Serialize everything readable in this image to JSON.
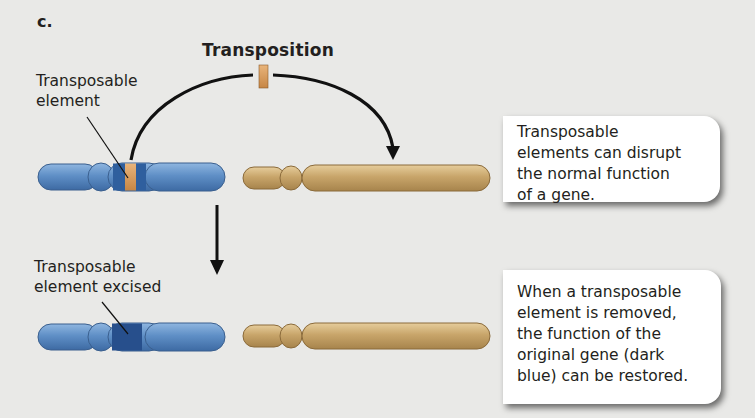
{
  "panel_label": "c.",
  "title": "Transposition",
  "labels": {
    "transposable_element": [
      "Transposable",
      "element"
    ],
    "element_excised": [
      "Transposable",
      "element excised"
    ]
  },
  "callouts": [
    {
      "lines": [
        "Transposable",
        "elements can disrupt",
        "the normal function",
        "of a gene."
      ]
    },
    {
      "lines": [
        "When a transposable",
        "element is removed,",
        "the function of the",
        "original gene (dark",
        "blue) can be restored."
      ]
    }
  ],
  "colors": {
    "background": "#e9e9e7",
    "chromosome_blue": "#5f8fc6",
    "chromosome_blue_dark": "#2f5f9e",
    "gene_dark_blue": "#274f8c",
    "chromosome_tan": "#c8a56a",
    "transposon": "#d39a5a",
    "arrow": "#111111"
  }
}
